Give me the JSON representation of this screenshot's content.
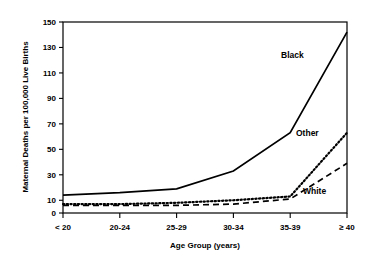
{
  "chart_data": {
    "type": "line",
    "title": "",
    "xlabel": "Age Group (years)",
    "ylabel": "Maternal Deaths per 100,000 Live Births",
    "categories": [
      "< 20",
      "20-24",
      "25-29",
      "30-34",
      "35-39",
      "≥ 40"
    ],
    "ylim": [
      0,
      150
    ],
    "yticks": [
      0,
      10,
      30,
      50,
      70,
      90,
      110,
      130,
      150
    ],
    "ytick_labels": [
      "0",
      "10",
      "30",
      "50",
      "70",
      "90",
      "110",
      "130",
      "150"
    ],
    "grid": false,
    "legend": "inline-annotations",
    "series": [
      {
        "name": "Black",
        "style": "solid",
        "color": "#000000",
        "label": "Black",
        "values": [
          14,
          16,
          19,
          33,
          63,
          142
        ]
      },
      {
        "name": "Other",
        "style": "dotted",
        "color": "#000000",
        "label": "Other",
        "values": [
          7,
          7,
          8,
          10,
          13,
          63
        ]
      },
      {
        "name": "White",
        "style": "dashed",
        "color": "#000000",
        "label": "White",
        "values": [
          6,
          6,
          6,
          7,
          11,
          39
        ]
      }
    ]
  },
  "axis": {
    "y_title": "Maternal Deaths per 100,000 Live Births",
    "x_title": "Age Group (years)"
  }
}
